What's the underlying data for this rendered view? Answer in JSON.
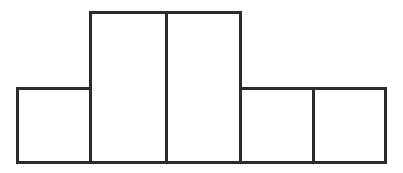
{
  "figure": {
    "background_color": "#ffffff",
    "stroke_color": "#2b2b2b",
    "fill_color": "#ffffff",
    "stroke_width": 3,
    "canvas": {
      "width": 403,
      "height": 173
    },
    "baseline_y": 162,
    "left_x": 17,
    "right_x": 385
  },
  "chart_data": {
    "type": "bar",
    "title": "",
    "xlabel": "",
    "ylabel": "",
    "grid": false,
    "legend": false,
    "orientation": "vertical",
    "categories": [
      "1",
      "2",
      "3",
      "4",
      "5"
    ],
    "values": [
      1,
      2,
      2,
      1,
      1
    ],
    "ylim": [
      0,
      2
    ],
    "xtick_labels": [],
    "ytick_labels": [],
    "annotations": [],
    "bars": [
      {
        "index": 0,
        "label": "1",
        "value": 1,
        "x_left": 17,
        "x_right": 90,
        "y_top": 88,
        "y_bottom": 162,
        "width_px": 73,
        "height_px": 74
      },
      {
        "index": 1,
        "label": "2",
        "value": 2,
        "x_left": 90,
        "x_right": 166,
        "y_top": 12,
        "y_bottom": 162,
        "width_px": 76,
        "height_px": 150
      },
      {
        "index": 2,
        "label": "3",
        "value": 2,
        "x_left": 166,
        "x_right": 240,
        "y_top": 12,
        "y_bottom": 162,
        "width_px": 74,
        "height_px": 150
      },
      {
        "index": 3,
        "label": "4",
        "value": 1,
        "x_left": 240,
        "x_right": 313,
        "y_top": 88,
        "y_bottom": 162,
        "width_px": 73,
        "height_px": 74
      },
      {
        "index": 4,
        "label": "5",
        "value": 1,
        "x_left": 313,
        "x_right": 385,
        "y_top": 88,
        "y_bottom": 162,
        "width_px": 72,
        "height_px": 74
      }
    ]
  }
}
